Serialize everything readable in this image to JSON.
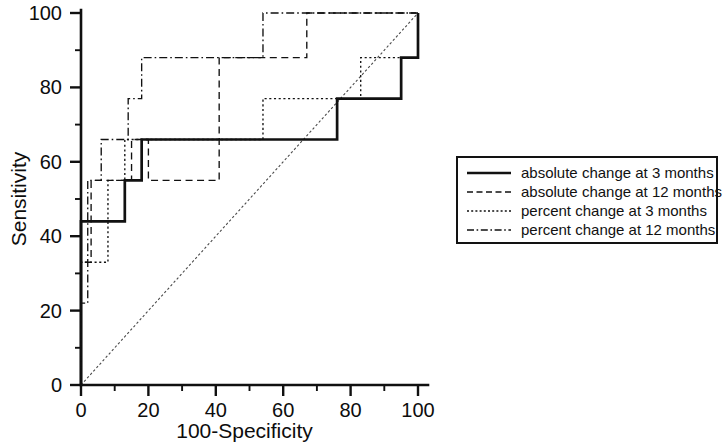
{
  "chart_data": {
    "type": "line",
    "title": "",
    "subtitle": "",
    "xlabel": "100-Specificity",
    "ylabel": "Sensitivity",
    "xlim": [
      0,
      100
    ],
    "ylim": [
      0,
      100
    ],
    "xticks": [
      0,
      20,
      40,
      60,
      80,
      100
    ],
    "yticks": [
      0,
      20,
      40,
      60,
      80,
      100
    ],
    "xticklabels": [
      "0",
      "20",
      "40",
      "60",
      "80",
      "100"
    ],
    "yticklabels": [
      "0",
      "20",
      "40",
      "60",
      "80",
      "100"
    ],
    "minor_tick_interval": 10,
    "grid": false,
    "legend_position": "right",
    "reference_line": {
      "name": "chance diagonal",
      "x": [
        0,
        100
      ],
      "y": [
        0,
        100
      ],
      "style": "dotted"
    },
    "series": [
      {
        "name": "absolute change at 3 months",
        "style": "solid",
        "points": [
          [
            0,
            0
          ],
          [
            0,
            44
          ],
          [
            13,
            44
          ],
          [
            13,
            55
          ],
          [
            18,
            55
          ],
          [
            18,
            66
          ],
          [
            76,
            66
          ],
          [
            76,
            77
          ],
          [
            95,
            77
          ],
          [
            95,
            88
          ],
          [
            100,
            88
          ],
          [
            100,
            100
          ]
        ]
      },
      {
        "name": "absolute change at 12 months",
        "style": "dashed",
        "points": [
          [
            0,
            0
          ],
          [
            0,
            33
          ],
          [
            3,
            33
          ],
          [
            3,
            55
          ],
          [
            15,
            55
          ],
          [
            15,
            66
          ],
          [
            20,
            66
          ],
          [
            20,
            55
          ],
          [
            41,
            55
          ],
          [
            41,
            88
          ],
          [
            67,
            88
          ],
          [
            67,
            100
          ],
          [
            83,
            100
          ],
          [
            100,
            100
          ]
        ]
      },
      {
        "name": "percent change at 3 months",
        "style": "dotted",
        "points": [
          [
            0,
            0
          ],
          [
            0,
            33
          ],
          [
            8,
            33
          ],
          [
            8,
            55
          ],
          [
            13,
            55
          ],
          [
            13,
            66
          ],
          [
            54,
            66
          ],
          [
            54,
            77
          ],
          [
            83,
            77
          ],
          [
            83,
            88
          ],
          [
            100,
            88
          ],
          [
            100,
            100
          ]
        ]
      },
      {
        "name": "percent change at 12 months",
        "style": "dashdot",
        "points": [
          [
            0,
            0
          ],
          [
            0,
            22
          ],
          [
            2,
            22
          ],
          [
            2,
            55
          ],
          [
            6,
            55
          ],
          [
            6,
            66
          ],
          [
            14,
            66
          ],
          [
            14,
            77
          ],
          [
            18,
            77
          ],
          [
            18,
            88
          ],
          [
            54,
            88
          ],
          [
            54,
            100
          ],
          [
            100,
            100
          ]
        ]
      }
    ]
  },
  "axes": {
    "x": {
      "label": "100-Specificity",
      "ticklabels": [
        "0",
        "20",
        "40",
        "60",
        "80",
        "100"
      ]
    },
    "y": {
      "label": "Sensitivity",
      "ticklabels": [
        "0",
        "20",
        "40",
        "60",
        "80",
        "100"
      ]
    }
  },
  "legend": {
    "entries": [
      {
        "label": "absolute change at 3 months",
        "style": "solid"
      },
      {
        "label": "absolute change at 12 months",
        "style": "dashed"
      },
      {
        "label": "percent change at 3 months",
        "style": "dotted"
      },
      {
        "label": "percent change at 12 months",
        "style": "dashdot"
      }
    ]
  },
  "colors": {
    "ink": "#111111",
    "background": "#ffffff",
    "diagonal": "#4a4a4a"
  }
}
